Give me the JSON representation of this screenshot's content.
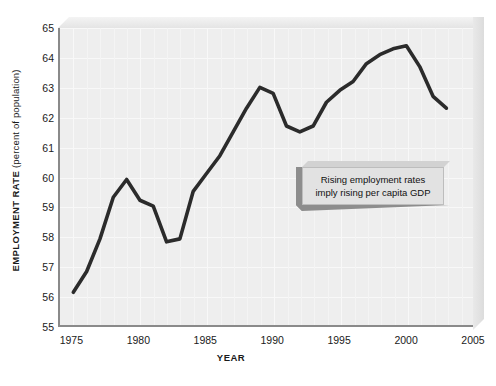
{
  "chart_data": {
    "type": "line",
    "title": "",
    "xlabel": "YEAR",
    "ylabel_main": "EMPLOYMENT RATE",
    "ylabel_sub": "(percent of population)",
    "xlim": [
      1974,
      2005
    ],
    "ylim": [
      55,
      65
    ],
    "xticks": [
      1975,
      1980,
      1985,
      1990,
      1995,
      2000,
      2005
    ],
    "yticks": [
      55,
      56,
      57,
      58,
      59,
      60,
      61,
      62,
      63,
      64,
      65
    ],
    "grid": true,
    "legend": "none",
    "line_color": "#2b2b2b",
    "plot_bg_color": "#eeeeee",
    "axis_color": "#8a8a8a",
    "series": [
      {
        "name": "Employment rate",
        "x": [
          1975,
          1976,
          1977,
          1978,
          1979,
          1980,
          1981,
          1982,
          1983,
          1984,
          1985,
          1986,
          1987,
          1988,
          1989,
          1990,
          1991,
          1992,
          1993,
          1994,
          1995,
          1996,
          1997,
          1998,
          1999,
          2000,
          2001,
          2002,
          2003
        ],
        "values": [
          56.1,
          56.8,
          57.9,
          59.3,
          59.9,
          59.2,
          59.0,
          57.8,
          57.9,
          59.5,
          60.1,
          60.7,
          61.5,
          62.3,
          63.0,
          62.8,
          61.7,
          61.5,
          61.7,
          62.5,
          62.9,
          63.2,
          63.8,
          64.1,
          64.3,
          64.4,
          63.7,
          62.7,
          62.3
        ]
      }
    ],
    "annotation": {
      "line1": "Rising employment rates",
      "line2": "imply rising per capita GDP"
    }
  }
}
